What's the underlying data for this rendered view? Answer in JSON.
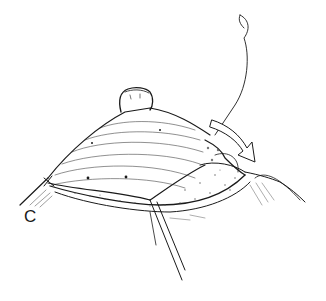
{
  "figure": {
    "panel_label": "C",
    "colors": {
      "ink": "#1a1a1a",
      "background": "#ffffff",
      "stipple": "#555555"
    }
  }
}
